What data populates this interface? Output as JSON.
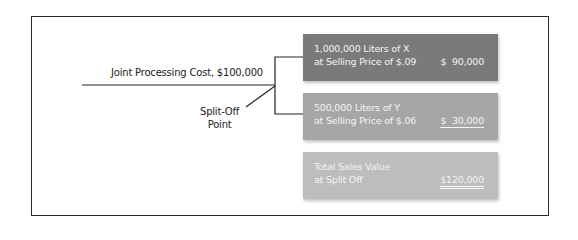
{
  "diagram": {
    "joint_cost_label": "Joint Processing Cost, $100,000",
    "split_off_label_line1": "Split-Off",
    "split_off_label_line2": "Point",
    "products": [
      {
        "line1": "1,000,000 Liters of X",
        "line2": "at Selling Price of $.09",
        "amount": "$  90,000",
        "color": "#7a7a7a"
      },
      {
        "line1": "500,000 Liters of Y",
        "line2": "at Selling Price of $.06",
        "amount": "$  30,000",
        "color": "#a6a6a6"
      }
    ],
    "total": {
      "line1": "Total Sales Value",
      "line2": "at Split Off",
      "amount": "$120,000",
      "color": "#bdbdbd"
    }
  }
}
